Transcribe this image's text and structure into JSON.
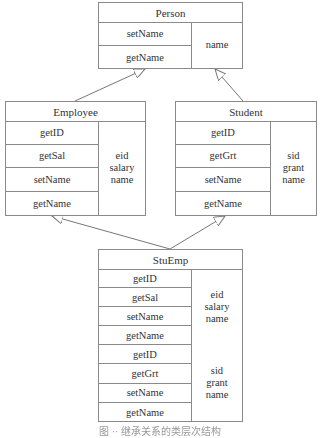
{
  "diagram": {
    "type": "uml-class-inheritance",
    "classes": {
      "person": {
        "name": "Person",
        "methods": [
          "setName",
          "getName"
        ],
        "attribute_groups": [
          [
            "name"
          ]
        ]
      },
      "employee": {
        "name": "Employee",
        "methods": [
          "getID",
          "getSal",
          "setName",
          "getName"
        ],
        "attribute_groups": [
          [
            "eid",
            "salary",
            "name"
          ]
        ]
      },
      "student": {
        "name": "Student",
        "methods": [
          "getID",
          "getGrt",
          "setName",
          "getName"
        ],
        "attribute_groups": [
          [
            "sid",
            "grant",
            "name"
          ]
        ]
      },
      "stuemp": {
        "name": "StuEmp",
        "methods": [
          "getID",
          "getSal",
          "setName",
          "getName",
          "getID",
          "getGrt",
          "setName",
          "getName"
        ],
        "attribute_groups": [
          [
            "eid",
            "salary",
            "name"
          ],
          [
            "sid",
            "grant",
            "name"
          ]
        ]
      }
    },
    "edges": [
      {
        "from": "Employee",
        "to": "Person",
        "type": "inheritance"
      },
      {
        "from": "Student",
        "to": "Person",
        "type": "inheritance"
      },
      {
        "from": "StuEmp",
        "to": "Employee",
        "type": "inheritance"
      },
      {
        "from": "StuEmp",
        "to": "Student",
        "type": "inheritance"
      }
    ],
    "colors": {
      "line": "#8a8a8a",
      "text": "#333333",
      "background": "#ffffff"
    }
  },
  "caption": "图 ·· 继承关系的类层次结构"
}
